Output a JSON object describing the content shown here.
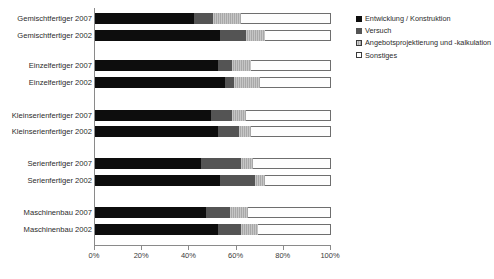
{
  "chart_data": {
    "type": "bar",
    "orientation": "horizontal",
    "stacked": true,
    "normalized": true,
    "title": "",
    "subtitle": "",
    "xlabel": "",
    "ylabel": "",
    "xlim": [
      0,
      100
    ],
    "xunit": "%",
    "grid": false,
    "legend_position": "right",
    "xticks": [
      0,
      20,
      40,
      60,
      80,
      100
    ],
    "xtick_labels": [
      "0%",
      "20%",
      "40%",
      "60%",
      "80%",
      "100%"
    ],
    "legend": [
      "Entwicklung / Konstruktion",
      "Versuch",
      "Angebotsprojektierung und -kalkulation",
      "Sonstiges"
    ],
    "series_colors": [
      "#0d0d0d",
      "#545454",
      "#a8a8a8",
      "#ffffff"
    ],
    "categories": [
      "Gemischtfertiger 2007",
      "Gemischtfertiger 2002",
      "Einzelfertiger 2007",
      "Einzelfertiger 2002",
      "Kleinserienfertiger 2007",
      "Kleinserienfertiger 2002",
      "Serienfertiger 2007",
      "Serienfertiger 2002",
      "Maschinenbau 2007",
      "Maschinenbau 2002"
    ],
    "series": [
      {
        "name": "Entwicklung / Konstruktion",
        "values": [
          42,
          53,
          52,
          55,
          49,
          52,
          45,
          53,
          47,
          52
        ]
      },
      {
        "name": "Versuch",
        "values": [
          8,
          11,
          6,
          4,
          9,
          9,
          17,
          15,
          10,
          10
        ]
      },
      {
        "name": "Angebotsprojektierung und -kalkulation",
        "values": [
          12,
          8,
          8,
          11,
          6,
          5,
          5,
          4,
          8,
          7
        ]
      },
      {
        "name": "Sonstiges",
        "values": [
          38,
          28,
          34,
          30,
          36,
          34,
          33,
          28,
          35,
          31
        ]
      }
    ],
    "rows": [
      {
        "label": "Gemischtfertiger 2007",
        "values": [
          42,
          8,
          12,
          38
        ]
      },
      {
        "label": "Gemischtfertiger 2002",
        "values": [
          53,
          11,
          8,
          28
        ]
      },
      {
        "label": "Einzelfertiger 2007",
        "values": [
          52,
          6,
          8,
          34
        ]
      },
      {
        "label": "Einzelfertiger 2002",
        "values": [
          55,
          4,
          11,
          30
        ]
      },
      {
        "label": "Kleinserienfertiger 2007",
        "values": [
          49,
          9,
          6,
          36
        ]
      },
      {
        "label": "Kleinserienfertiger 2002",
        "values": [
          52,
          9,
          5,
          34
        ]
      },
      {
        "label": "Serienfertiger 2007",
        "values": [
          45,
          17,
          5,
          33
        ]
      },
      {
        "label": "Serienfertiger 2002",
        "values": [
          53,
          15,
          4,
          28
        ]
      },
      {
        "label": "Maschinenbau 2007",
        "values": [
          47,
          10,
          8,
          35
        ]
      },
      {
        "label": "Maschinenbau 2002",
        "values": [
          52,
          10,
          7,
          31
        ]
      }
    ]
  },
  "layout": {
    "plot_left_px": 94,
    "plot_top_px": 8,
    "plot_width_px": 236,
    "plot_height_px": 237,
    "row_tops_px": [
      13,
      30,
      60,
      77,
      110,
      126,
      158,
      175,
      207,
      224
    ]
  }
}
